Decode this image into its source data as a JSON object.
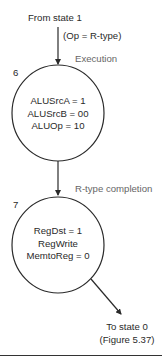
{
  "diagram": {
    "entry": {
      "from_label": "From state 1",
      "condition": "(Op = R-type)"
    },
    "states": [
      {
        "id": "6",
        "phase": "Execution",
        "signals": [
          "ALUSrcA = 1",
          "ALUSrcB = 00",
          "ALUOp = 10"
        ]
      },
      {
        "id": "7",
        "phase": "R-type completion",
        "signals": [
          "RegDst = 1",
          "RegWrite",
          "MemtoReg = 0"
        ]
      }
    ],
    "exit": {
      "to_label": "To state 0",
      "reference": "(Figure 5.37)"
    },
    "colors": {
      "line": "#2a2a2a",
      "phase_text": "#666666"
    }
  }
}
